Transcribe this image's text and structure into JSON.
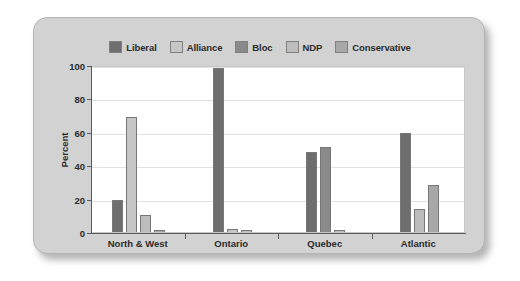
{
  "chart_data": {
    "type": "bar",
    "title": "",
    "xlabel": "",
    "ylabel": "Percent",
    "ylim": [
      0,
      100
    ],
    "yticks": [
      0,
      20,
      40,
      60,
      80,
      100
    ],
    "grid": true,
    "legend_position": "top-center",
    "categories": [
      "North & West",
      "Ontario",
      "Quebec",
      "Atlantic"
    ],
    "series": [
      {
        "name": "Liberal",
        "color": "#6e6e6e",
        "values": [
          19,
          98,
          48,
          59
        ]
      },
      {
        "name": "Alliance",
        "color": "#c6c6c6",
        "values": [
          69,
          2,
          0,
          0
        ]
      },
      {
        "name": "Bloc",
        "color": "#8a8a8a",
        "values": [
          0,
          0,
          51,
          0
        ]
      },
      {
        "name": "NDP",
        "color": "#bdbdbd",
        "values": [
          10,
          1,
          1,
          14
        ]
      },
      {
        "name": "Conservative",
        "color": "#a8a8a8",
        "values": [
          1,
          0,
          0,
          28
        ]
      }
    ]
  }
}
